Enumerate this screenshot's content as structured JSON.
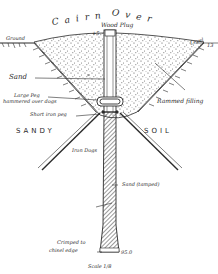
{
  "diagram": {
    "title_word_1": "Cairn",
    "title_word_2": "Over",
    "labels": {
      "wood_plug": "Wood Plug",
      "top_value": "+5",
      "ground_left": "Ground",
      "level_right": "Level",
      "level_value": "13",
      "sand": "Sand",
      "large_peg_line1": "Large Peg",
      "large_peg_line2": "hammered over dogs",
      "rammed_filling": "Rammed filling",
      "short_iron_peg": "Short iron peg",
      "sandy": "SANDY",
      "soil": "SOIL",
      "iron_dogs": "Iron Dogs",
      "sand_tamped": "Sand (tamped)",
      "crimped_line1": "Crimped to",
      "crimped_line2": "chisel edge",
      "bottom_value": "95.0",
      "scale": "Scale 1/8"
    },
    "colors": {
      "ink": "#2a2a2a",
      "paper": "#ffffff",
      "stipple": "#555555"
    }
  }
}
